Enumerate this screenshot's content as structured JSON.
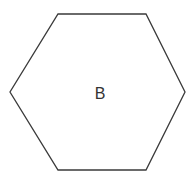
{
  "figure": {
    "background_color": "#ffffff",
    "width": 195,
    "height": 179,
    "shape": {
      "kind": "hexagon",
      "orientation": "flat-top",
      "label": "B",
      "label_color": "#333333",
      "label_x": 100,
      "label_y": 95,
      "stroke_color": "#3a3a3a",
      "fill_color": "#ffffff",
      "stroke_width": 1.3,
      "points": "58,14 146,14 185,92 146,170 58,170 10,92",
      "vertices": [
        {
          "name": "top-left",
          "x": 58,
          "y": 14
        },
        {
          "name": "top-right",
          "x": 146,
          "y": 14
        },
        {
          "name": "right",
          "x": 185,
          "y": 92
        },
        {
          "name": "bottom-right",
          "x": 146,
          "y": 170
        },
        {
          "name": "bottom-left",
          "x": 58,
          "y": 170
        },
        {
          "name": "left",
          "x": 10,
          "y": 92
        }
      ]
    }
  }
}
